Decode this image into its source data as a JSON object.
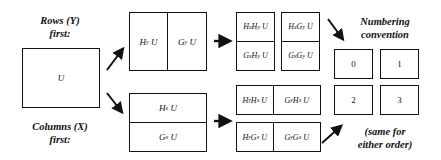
{
  "labels": {
    "rows_first": [
      "Rows (Y)",
      "first:"
    ],
    "columns_first": [
      "Columns (X)",
      "first:"
    ],
    "numbering": [
      "Numbering",
      "convention"
    ],
    "same_order": [
      "(same for",
      "either order)"
    ]
  },
  "original": {
    "text": "U"
  },
  "rows_first": {
    "level1": [
      "HyU",
      "GyU"
    ],
    "level2": [
      [
        "HxHyU",
        "GxHyU"
      ],
      [
        "HxGyU",
        "GxGyU"
      ]
    ]
  },
  "columns_first": {
    "level1": [
      "HxU",
      "GxU"
    ],
    "level2": [
      [
        "HyHxU",
        "GyHxU"
      ],
      [
        "HyGxU",
        "GyGxU"
      ]
    ]
  },
  "numbering": [
    "0",
    "1",
    "2",
    "3"
  ]
}
